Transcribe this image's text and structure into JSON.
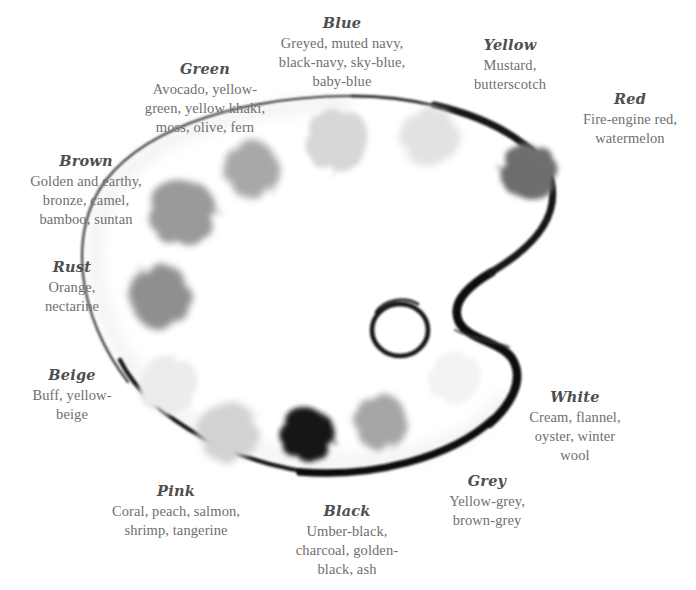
{
  "artwork": {
    "name": "artist-paint-palette",
    "description": "Oval artist's palette with thumb hole and twelve paint blobs, rendered in greyscale",
    "outline_color": "#0d0d0d",
    "body_color": "#ffffff",
    "shadow_color": "#e9e9e9",
    "thumb_hole": {
      "cx": 400,
      "cy": 330,
      "rx": 28,
      "ry": 26
    }
  },
  "blobs": [
    {
      "id": "blob-brown",
      "label": "Brown",
      "cx": 182,
      "cy": 212,
      "color": "#9a9a9a",
      "size": 62
    },
    {
      "id": "blob-green",
      "label": "Green",
      "cx": 252,
      "cy": 169,
      "color": "#a8a8a8",
      "size": 52
    },
    {
      "id": "blob-blue",
      "label": "Blue",
      "cx": 337,
      "cy": 140,
      "color": "#d7d7d7",
      "size": 58
    },
    {
      "id": "blob-yellow",
      "label": "Yellow",
      "cx": 430,
      "cy": 137,
      "color": "#e2e2e2",
      "size": 54
    },
    {
      "id": "blob-red",
      "label": "Red",
      "cx": 529,
      "cy": 172,
      "color": "#6e6e6e",
      "size": 52
    },
    {
      "id": "blob-rust",
      "label": "Rust",
      "cx": 160,
      "cy": 297,
      "color": "#8f8f8f",
      "size": 58
    },
    {
      "id": "blob-beige",
      "label": "Beige",
      "cx": 168,
      "cy": 385,
      "color": "#ececec",
      "size": 54
    },
    {
      "id": "blob-pink",
      "label": "Pink",
      "cx": 228,
      "cy": 432,
      "color": "#d2d2d2",
      "size": 56
    },
    {
      "id": "blob-black",
      "label": "Black",
      "cx": 307,
      "cy": 434,
      "color": "#151515",
      "size": 50
    },
    {
      "id": "blob-grey",
      "label": "Grey",
      "cx": 381,
      "cy": 422,
      "color": "#a6a6a6",
      "size": 50
    },
    {
      "id": "blob-white",
      "label": "White",
      "cx": 455,
      "cy": 378,
      "color": "#f3f3f3",
      "size": 48
    }
  ],
  "labels": [
    {
      "id": "green",
      "title": "Green",
      "description": "Avocado, yellow-green, yellow khaki, moss, olive, fern",
      "lines": [
        "Avocado, yellow-",
        "green, yellow khaki,",
        "moss, olive, fern"
      ],
      "align": "center",
      "x": 126,
      "y": 60,
      "w": 158
    },
    {
      "id": "blue",
      "title": "Blue",
      "description": "Greyed, muted navy, black-navy, sky-blue, baby-blue",
      "lines": [
        "Greyed, muted navy,",
        "black-navy, sky-blue,",
        "baby-blue"
      ],
      "align": "center",
      "x": 266,
      "y": 14,
      "w": 152
    },
    {
      "id": "yellow",
      "title": "Yellow",
      "description": "Mustard, butterscotch",
      "lines": [
        "Mustard,",
        "butterscotch"
      ],
      "align": "center",
      "x": 454,
      "y": 36,
      "w": 112
    },
    {
      "id": "red",
      "title": "Red",
      "description": "Fire-engine red, watermelon",
      "lines": [
        "Fire-engine red,",
        "watermelon"
      ],
      "align": "center",
      "x": 567,
      "y": 90,
      "w": 126
    },
    {
      "id": "brown",
      "title": "Brown",
      "description": "Golden and earthy, bronze, camel, bamboo, suntan",
      "lines": [
        "Golden and earthy,",
        "bronze, camel,",
        "bamboo, suntan"
      ],
      "align": "center",
      "x": 12,
      "y": 152,
      "w": 148
    },
    {
      "id": "rust",
      "title": "Rust",
      "description": "Orange, nectarine",
      "lines": [
        "Orange,",
        "nectarine"
      ],
      "align": "center",
      "x": 22,
      "y": 258,
      "w": 100
    },
    {
      "id": "beige",
      "title": "Beige",
      "description": "Buff, yellow-beige",
      "lines": [
        "Buff, yellow-",
        "beige"
      ],
      "align": "center",
      "x": 22,
      "y": 366,
      "w": 100
    },
    {
      "id": "pink",
      "title": "Pink",
      "description": "Coral, peach, salmon, shrimp, tangerine",
      "lines": [
        "Coral, peach, salmon,",
        "shrimp, tangerine"
      ],
      "align": "center",
      "x": 95,
      "y": 482,
      "w": 162
    },
    {
      "id": "black",
      "title": "Black",
      "description": "Umber-black, charcoal, golden-black, ash",
      "lines": [
        "Umber-black,",
        "charcoal, golden-",
        "black, ash"
      ],
      "align": "center",
      "x": 277,
      "y": 502,
      "w": 140
    },
    {
      "id": "grey",
      "title": "Grey",
      "description": "Yellow-grey, brown-grey",
      "lines": [
        "Yellow-grey,",
        "brown-grey"
      ],
      "align": "center",
      "x": 428,
      "y": 472,
      "w": 118
    },
    {
      "id": "white",
      "title": "White",
      "description": "Cream, flannel, oyster, winter wool",
      "lines": [
        "Cream, flannel,",
        "oyster, winter",
        "wool"
      ],
      "align": "center",
      "x": 514,
      "y": 388,
      "w": 122
    }
  ]
}
